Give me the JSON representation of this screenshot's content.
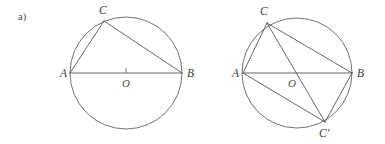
{
  "figure": {
    "part_label": "a)",
    "background_color": "#ffffff",
    "line_color": "#555555",
    "label_color": "#3b3b3b",
    "width": 385,
    "height": 144
  },
  "panels": [
    {
      "id": "left-panel",
      "description": "circle with inscribed right triangle ACB on diameter AB",
      "circle": {
        "cx": 126,
        "cy": 73,
        "r": 56
      },
      "center_tick": true,
      "points": [
        {
          "name": "A",
          "label": "A",
          "x": 70,
          "y": 73,
          "label_x": 60,
          "label_y": 77
        },
        {
          "name": "B",
          "label": "B",
          "x": 182,
          "y": 73,
          "label_x": 187,
          "label_y": 77
        },
        {
          "name": "C",
          "label": "C",
          "x": 104,
          "y": 21,
          "label_x": 99,
          "label_y": 14
        },
        {
          "name": "O",
          "label": "O",
          "x": 126,
          "y": 73,
          "label_x": 122,
          "label_y": 87
        }
      ],
      "segments": [
        {
          "from": "A",
          "to": "B",
          "name": "diameter-ab"
        },
        {
          "from": "A",
          "to": "C",
          "name": "chord-ac"
        },
        {
          "from": "C",
          "to": "B",
          "name": "chord-cb"
        }
      ]
    },
    {
      "id": "right-panel",
      "description": "circle with inscribed quadrilateral ACBC-prime and diagonal CC-prime",
      "circle": {
        "cx": 297,
        "cy": 73,
        "r": 55
      },
      "center_tick": false,
      "points": [
        {
          "name": "A",
          "label": "A",
          "x": 243,
          "y": 73,
          "label_x": 232,
          "label_y": 77
        },
        {
          "name": "B",
          "label": "B",
          "x": 352,
          "y": 73,
          "label_x": 357,
          "label_y": 77
        },
        {
          "name": "C",
          "label": "C",
          "x": 267,
          "y": 23,
          "label_x": 260,
          "label_y": 15
        },
        {
          "name": "Cprime",
          "label": "C'",
          "x": 325,
          "y": 122,
          "label_x": 319,
          "label_y": 137
        },
        {
          "name": "O",
          "label": "O",
          "x": 297,
          "y": 73,
          "label_x": 288,
          "label_y": 87
        }
      ],
      "segments": [
        {
          "from": "A",
          "to": "B",
          "name": "diameter-ab"
        },
        {
          "from": "A",
          "to": "C",
          "name": "chord-ac"
        },
        {
          "from": "C",
          "to": "B",
          "name": "chord-cb"
        },
        {
          "from": "C",
          "to": "Cprime",
          "name": "chord-cc-prime"
        },
        {
          "from": "A",
          "to": "Cprime",
          "name": "chord-ac-prime"
        },
        {
          "from": "Cprime",
          "to": "B",
          "name": "chord-c-prime-b"
        }
      ]
    }
  ]
}
